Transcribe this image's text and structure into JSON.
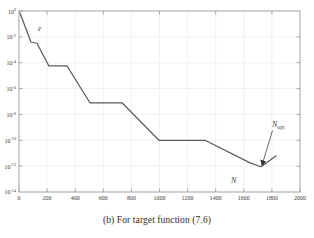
{
  "caption": "(b) For target function (7.6)",
  "chart_data": {
    "type": "line",
    "title": "",
    "xlabel": "N",
    "ylabel": "e",
    "xlim": [
      0,
      2000
    ],
    "ylim": [
      1e-14,
      1
    ],
    "yscale": "log",
    "xscale": "linear",
    "grid": true,
    "legend": null,
    "x_ticks": [
      0,
      200,
      400,
      600,
      800,
      1000,
      1200,
      1400,
      1600,
      1800,
      2000
    ],
    "x_tick_labels": [
      "0",
      "200",
      "400",
      "600",
      "800",
      "1000",
      "1200",
      "1400",
      "1600",
      "1800",
      "2000"
    ],
    "y_ticks": [
      1,
      0.01,
      0.0001,
      1e-06,
      1e-08,
      1e-10,
      1e-12,
      1e-14
    ],
    "y_tick_labels": [
      "10^0",
      "10^-2",
      "10^-4",
      "10^-6",
      "10^-8",
      "10^-10",
      "10^-12",
      "10^-14"
    ],
    "y_tick_exponents": [
      "0",
      "-2",
      "-4",
      "-6",
      "-8",
      "-10",
      "-12",
      "-14"
    ],
    "series": [
      {
        "name": "error",
        "color": "#5a5a5a",
        "x": [
          7,
          85,
          128,
          213,
          342,
          505,
          733,
          996,
          1324,
          1645,
          1723,
          1830
        ],
        "y": [
          0.71,
          0.004,
          0.0032,
          5.6e-05,
          5.6e-05,
          8e-08,
          8e-08,
          1e-10,
          1e-10,
          1.8e-12,
          9e-13,
          6.3e-12
        ]
      }
    ],
    "annotations": [
      {
        "name": "error-axis-label",
        "text": "e",
        "x": 135,
        "y": 0.2,
        "italic": true
      },
      {
        "name": "n-axis-label",
        "text": "N",
        "x": 1510,
        "y": 2e-14,
        "italic": true
      },
      {
        "name": "n-opt-annotation",
        "text": "N",
        "subscript": "opt",
        "x": 1880,
        "y": 1.2e-09,
        "arrow_to_x": 1723,
        "arrow_to_y": 9e-13,
        "italic": true
      }
    ]
  },
  "colors": {
    "curve": "#5a5a5a",
    "axis": "#8c8c8c",
    "grid": "#e2e2e2",
    "text": "#3a3a3a",
    "background": "#ffffff"
  }
}
